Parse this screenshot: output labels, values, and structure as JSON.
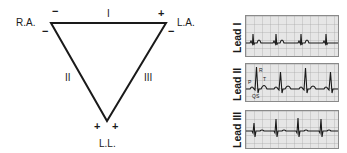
{
  "triangle": {
    "vertices": {
      "right_arm": "R.A.",
      "left_arm": "L.A.",
      "left_leg": "L.L."
    },
    "sides": {
      "top": "I",
      "left": "II",
      "right": "III"
    },
    "polarity": {
      "ra_top": "−",
      "ra_left": "−",
      "la_top": "+",
      "la_right": "−",
      "ll_left": "+",
      "ll_right": "+"
    }
  },
  "ecg_strips": [
    {
      "label": "Lead I"
    },
    {
      "label": "Lead II",
      "wave_labels": {
        "p": "P",
        "q": "Q",
        "r": "R",
        "s": "S",
        "t": "T"
      }
    },
    {
      "label": "Lead III"
    }
  ],
  "colors": {
    "line": "#1a1a1a",
    "grid_bg": "#e6e6e6",
    "grid_line": "#9a9a9a"
  }
}
